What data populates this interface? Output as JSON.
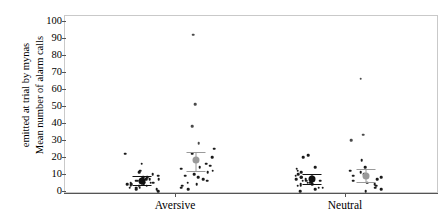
{
  "chart_data": {
    "type": "scatter",
    "title": "",
    "xlabel": "",
    "ylabel_line1": "Mean number of alarm calls",
    "ylabel_line2": "emitted at trial by mynas",
    "ylim": [
      0,
      100
    ],
    "yticks": [
      0,
      10,
      20,
      30,
      40,
      50,
      60,
      70,
      80,
      90,
      100
    ],
    "grid": false,
    "legend": "none",
    "categories": [
      "Aversive",
      "Neutral"
    ],
    "subgroups": [
      {
        "name": "aversive-control",
        "category": "Aversive",
        "marker_color": "#111111",
        "mean": 6,
        "error_low": 3.5,
        "error_high": 9,
        "points": [
          4,
          5,
          6,
          6,
          7,
          3,
          2,
          8,
          9,
          5,
          4,
          7,
          10,
          12,
          1,
          2,
          3,
          6,
          5,
          4,
          8,
          11,
          2,
          1,
          16,
          22,
          5,
          3,
          0,
          7
        ]
      },
      {
        "name": "aversive-treatment",
        "category": "Aversive",
        "marker_color": "#9a9a9a",
        "mean": 18,
        "error_low": 12,
        "error_high": 23,
        "points": [
          92,
          51,
          38,
          28,
          25,
          20,
          18,
          16,
          14,
          12,
          10,
          9,
          7,
          6,
          5,
          4,
          3,
          2,
          1,
          13,
          11,
          8,
          22,
          15
        ]
      },
      {
        "name": "neutral-control",
        "category": "Neutral",
        "marker_color": "#111111",
        "mean": 7,
        "error_low": 4,
        "error_high": 10,
        "points": [
          5,
          6,
          7,
          8,
          4,
          3,
          2,
          9,
          10,
          12,
          14,
          20,
          21,
          6,
          5,
          4,
          3,
          7,
          8,
          1,
          0,
          2,
          11,
          13,
          6,
          5
        ]
      },
      {
        "name": "neutral-treatment",
        "category": "Neutral",
        "marker_color": "#9a9a9a",
        "mean": 9,
        "error_low": 5,
        "error_high": 13,
        "points": [
          66,
          33,
          30,
          18,
          14,
          11,
          10,
          8,
          7,
          6,
          5,
          4,
          3,
          2,
          1,
          9,
          12,
          0
        ]
      }
    ]
  },
  "axis": {
    "y_tick_labels": [
      "100",
      "90",
      "80",
      "70",
      "60",
      "50",
      "40",
      "30",
      "20",
      "10",
      "0"
    ],
    "x_tick_labels": [
      "Aversive",
      "Neutral"
    ]
  }
}
